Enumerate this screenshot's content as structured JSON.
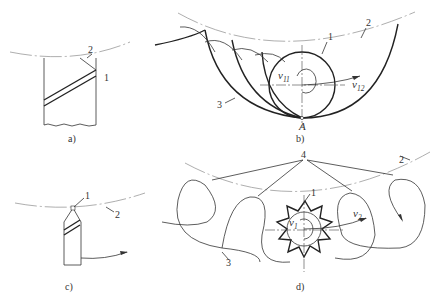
{
  "figure": {
    "panels": [
      {
        "id": "a",
        "caption": "a)",
        "labels": [
          "1",
          "2"
        ]
      },
      {
        "id": "b",
        "caption": "b)",
        "labels": [
          "1",
          "2",
          "3"
        ],
        "velocity_labels": [
          {
            "symbol": "v",
            "sub": "11"
          },
          {
            "symbol": "v",
            "sub": "12"
          }
        ],
        "point_label": "A"
      },
      {
        "id": "c",
        "caption": "c)",
        "labels": [
          "1",
          "2"
        ]
      },
      {
        "id": "d",
        "caption": "d)",
        "labels": [
          "1",
          "2",
          "3",
          "4"
        ],
        "velocity_labels": [
          {
            "symbol": "v",
            "sub": "1"
          },
          {
            "symbol": "v",
            "sub": "2"
          }
        ]
      }
    ]
  },
  "a": {
    "caption": "a)",
    "l1": "1",
    "l2": "2"
  },
  "b": {
    "caption": "b)",
    "l1": "1",
    "l2": "2",
    "l3": "3",
    "v11": "v",
    "v11_sub": "11",
    "v12": "v",
    "v12_sub": "12",
    "pointA": "A"
  },
  "c": {
    "caption": "c)",
    "l1": "1",
    "l2": "2"
  },
  "d": {
    "caption": "d)",
    "l1": "1",
    "l2": "2",
    "l3": "3",
    "l4": "4",
    "v1": "v",
    "v1_sub": "1",
    "v2": "v",
    "v2_sub": "2"
  }
}
